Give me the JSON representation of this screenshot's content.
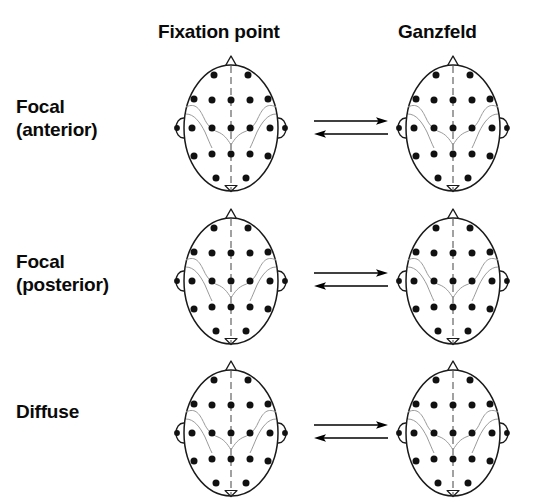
{
  "figure": {
    "title_present": false,
    "columns": [
      {
        "label": "Fixation point",
        "name": "fixation-point"
      },
      {
        "label": "Ganzfeld",
        "name": "ganzfeld"
      }
    ],
    "rows": [
      {
        "label": "Focal\n(anterior)",
        "line1": "Focal",
        "line2": "(anterior)",
        "name": "focal-anterior"
      },
      {
        "label": "Focal\n(posterior)",
        "line1": "Focal",
        "line2": "(posterior)",
        "name": "focal-posterior"
      },
      {
        "label": "Diffuse",
        "line1": "Diffuse",
        "line2": "",
        "name": "diffuse"
      }
    ],
    "arrows": {
      "direction": "bidirectional",
      "top_arrow": "right",
      "bottom_arrow": "left",
      "count_per_row": 2
    },
    "colors": {
      "ink": "#000000",
      "background": "#ffffff",
      "electrode": "#111111",
      "outline": "#1a1a1a",
      "sulcus": "#9a9a9a"
    },
    "headmap": {
      "view": "top-down",
      "nose_marker": "triangle-top",
      "inion_marker": "triangle-bottom",
      "midline": "dashed-vertical",
      "ears": 2,
      "electrode_count": 21,
      "montage": "10-20",
      "electrodes": [
        {
          "label": "Fp1",
          "x": 42,
          "y": 23
        },
        {
          "label": "Fp2",
          "x": 76,
          "y": 23
        },
        {
          "label": "F7",
          "x": 22,
          "y": 47
        },
        {
          "label": "F3",
          "x": 40,
          "y": 48
        },
        {
          "label": "Fz",
          "x": 59,
          "y": 48
        },
        {
          "label": "F4",
          "x": 78,
          "y": 48
        },
        {
          "label": "F8",
          "x": 96,
          "y": 47
        },
        {
          "label": "A1",
          "x": 5,
          "y": 76
        },
        {
          "label": "T3",
          "x": 20,
          "y": 76
        },
        {
          "label": "C3",
          "x": 40,
          "y": 76
        },
        {
          "label": "Cz",
          "x": 59,
          "y": 76
        },
        {
          "label": "C4",
          "x": 78,
          "y": 76
        },
        {
          "label": "T4",
          "x": 98,
          "y": 76
        },
        {
          "label": "A2",
          "x": 113,
          "y": 76
        },
        {
          "label": "T5",
          "x": 22,
          "y": 104
        },
        {
          "label": "P3",
          "x": 40,
          "y": 102
        },
        {
          "label": "Pz",
          "x": 59,
          "y": 102
        },
        {
          "label": "P4",
          "x": 78,
          "y": 102
        },
        {
          "label": "T6",
          "x": 96,
          "y": 104
        },
        {
          "label": "O1",
          "x": 44,
          "y": 126
        },
        {
          "label": "O2",
          "x": 74,
          "y": 126
        }
      ]
    },
    "panels": [
      {
        "row": "focal-anterior",
        "column": "fixation-point",
        "name": "headmap-focal-anterior-fixation"
      },
      {
        "row": "focal-anterior",
        "column": "ganzfeld",
        "name": "headmap-focal-anterior-ganzfeld"
      },
      {
        "row": "focal-posterior",
        "column": "fixation-point",
        "name": "headmap-focal-posterior-fixation"
      },
      {
        "row": "focal-posterior",
        "column": "ganzfeld",
        "name": "headmap-focal-posterior-ganzfeld"
      },
      {
        "row": "diffuse",
        "column": "fixation-point",
        "name": "headmap-diffuse-fixation"
      },
      {
        "row": "diffuse",
        "column": "ganzfeld",
        "name": "headmap-diffuse-ganzfeld"
      }
    ]
  }
}
